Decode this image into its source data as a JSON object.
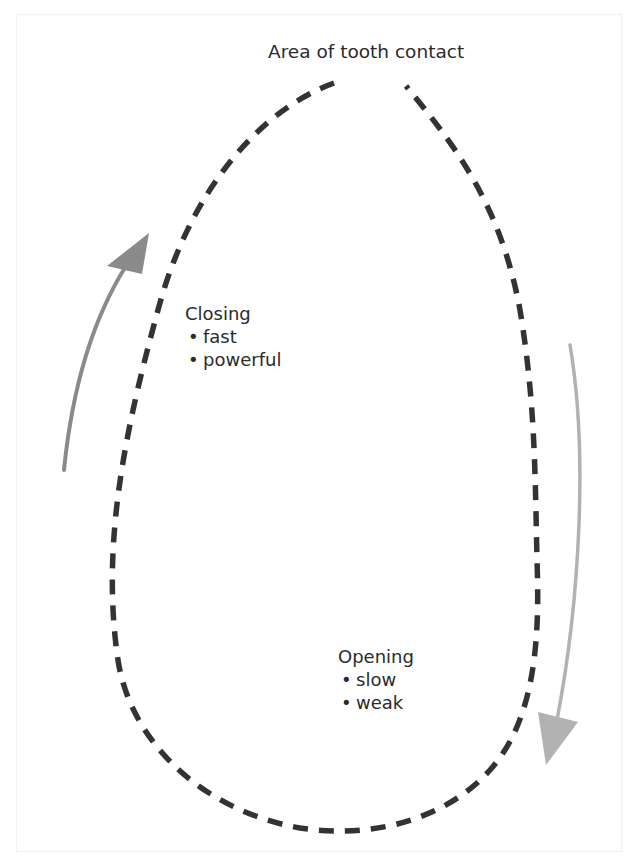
{
  "figure": {
    "title": "Area of tooth contact",
    "closing": {
      "heading": "Closing",
      "items": [
        "fast",
        "powerful"
      ]
    },
    "opening": {
      "heading": "Opening",
      "items": [
        "slow",
        "weak"
      ]
    }
  },
  "colors": {
    "loop": "#333333",
    "closing_arrow": "#8a8a8a",
    "opening_arrow": "#b2b2b2",
    "text": "#2b2b2b",
    "background": "#ffffff"
  },
  "icons": {
    "closing_arrow": "arrow-up-curved-icon",
    "opening_arrow": "arrow-down-curved-icon"
  }
}
